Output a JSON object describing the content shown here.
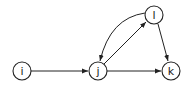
{
  "diagram": {
    "type": "directed-graph",
    "colors": {
      "stroke": "#222222",
      "background": "#ffffff"
    },
    "nodes": [
      {
        "id": "i",
        "label": "i",
        "x": 22,
        "y": 71
      },
      {
        "id": "j",
        "label": "j",
        "x": 98,
        "y": 71
      },
      {
        "id": "k",
        "label": "k",
        "x": 171,
        "y": 71
      },
      {
        "id": "l",
        "label": "l",
        "x": 154,
        "y": 15
      }
    ],
    "edges": [
      {
        "from": "i",
        "to": "j",
        "shape": "straight"
      },
      {
        "from": "j",
        "to": "k",
        "shape": "straight"
      },
      {
        "from": "j",
        "to": "l",
        "shape": "straight"
      },
      {
        "from": "l",
        "to": "j",
        "shape": "curved"
      },
      {
        "from": "l",
        "to": "k",
        "shape": "straight"
      }
    ]
  }
}
